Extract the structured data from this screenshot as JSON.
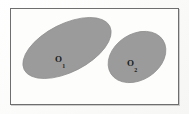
{
  "figure": {
    "title": "",
    "background_color": "#fcfcfb",
    "frame": {
      "name": "figure-border",
      "border_color": "#6e6e6e",
      "fill_color": "#fdfdfc",
      "x": 10,
      "y": 8,
      "width": 169,
      "height": 97
    },
    "shapes": [
      {
        "id": "o1",
        "type": "ellipse",
        "label_base": "O",
        "label_sub": "1",
        "fill_color": "#9b9b9b",
        "edge_color": "#8d8d8d",
        "cx": 67,
        "cy": 48,
        "rx": 48,
        "ry": 24,
        "rotation_deg": -27
      },
      {
        "id": "o2",
        "type": "ellipse",
        "label_base": "O",
        "label_sub": "2",
        "fill_color": "#9b9b9b",
        "edge_color": "#8d8d8d",
        "cx": 137,
        "cy": 57,
        "rx": 31,
        "ry": 23,
        "rotation_deg": -33
      }
    ]
  }
}
